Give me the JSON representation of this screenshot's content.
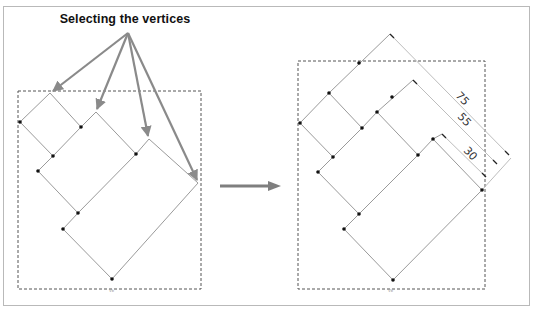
{
  "title": "Selecting the vertices",
  "dimensions": {
    "outer": "75",
    "middle": "55",
    "inner": "30"
  },
  "box_label_left": "Vb",
  "box_label_right": "Vb",
  "colors": {
    "arrow": "#8a8a8a",
    "shape_stroke": "#9a9a9a",
    "vertex": "#111111",
    "dashed_box": "#555555",
    "frame": "#b9b9b9"
  },
  "panels": [
    {
      "name": "before",
      "description": "Shape with selected vertices (arrows indicate vertices to select)"
    },
    {
      "name": "after",
      "description": "Shape with aligned dimensions 75, 55, 30"
    }
  ]
}
